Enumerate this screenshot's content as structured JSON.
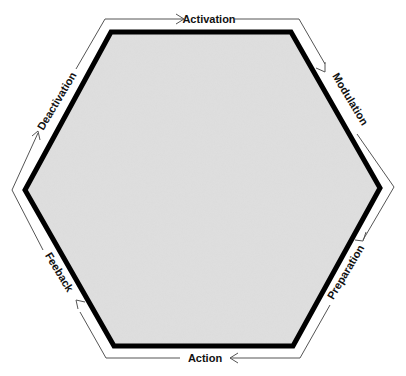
{
  "diagram": {
    "type": "cycle",
    "shape": "hexagon",
    "colors": {
      "fill": "#dcdcdc",
      "border": "#000000",
      "cycle_line": "#555555",
      "text": "#111111"
    },
    "stages": [
      {
        "id": "activation",
        "label": "Activation",
        "position": "top"
      },
      {
        "id": "modulation",
        "label": "Modulation",
        "position": "upper-right"
      },
      {
        "id": "preparation",
        "label": "Preparation",
        "position": "lower-right"
      },
      {
        "id": "action",
        "label": "Action",
        "position": "bottom"
      },
      {
        "id": "feeback",
        "label": "Feeback",
        "position": "lower-left"
      },
      {
        "id": "deactivation",
        "label": "Deactivation",
        "position": "upper-left"
      }
    ],
    "direction": "clockwise"
  }
}
